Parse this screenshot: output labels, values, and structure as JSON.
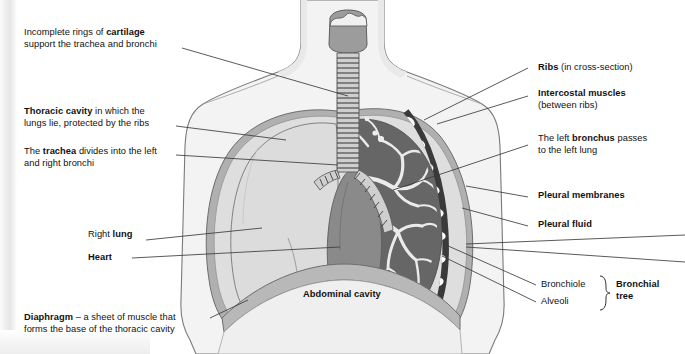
{
  "figure": {
    "title_text": "",
    "background_color": "#ffffff",
    "ink_color": "#111111"
  },
  "palette": {
    "skin_body": "#f2f2f2",
    "body_outline": "#6f6f6f",
    "pleural_membrane": "#a9a9a9",
    "pleural_fluid": "#e3e3e3",
    "right_lung": "#dcdcdc",
    "left_lung": "#6b6b6b",
    "bronchial_tree": "#efefef",
    "heart": "#8c8c8c",
    "trachea": "#9a9a9a",
    "rib_white": "#ffffff",
    "intercostal": "#3a3a3a",
    "diaphragm": "#b5b5b5",
    "abdominal_cavity": "#efefef",
    "leader_line": "#3c3c3c"
  },
  "labels": {
    "cartilage": {
      "line1_plain": "Incomplete rings of ",
      "line1_bold": "cartilage",
      "line2": "support the trachea and bronchi"
    },
    "thoracic_cavity": {
      "line1_bold": "Thoracic cavity",
      "line1_plain": " in which the",
      "line2": "lungs lie, protected by the ribs"
    },
    "trachea": {
      "line1_pre": "The ",
      "line1_bold": "trachea",
      "line1_post": " divides into the left",
      "line2": "and right bronchi"
    },
    "right_lung": {
      "pre": "Right ",
      "bold": "lung"
    },
    "heart": {
      "bold": "Heart"
    },
    "diaphragm": {
      "line1_bold": "Diaphragm",
      "line1_plain": " – a sheet of muscle that",
      "line2": "forms the base of the thoracic cavity"
    },
    "abdominal_cavity": {
      "bold": "Abdominal cavity"
    },
    "ribs": {
      "bold": "Ribs",
      "plain": " (in cross-section)"
    },
    "intercostal_muscles": {
      "line1_bold": "Intercostal muscles",
      "line2": "(between ribs)"
    },
    "left_bronchus": {
      "line1_pre": "The left ",
      "line1_bold": "bronchus",
      "line1_post": " passes",
      "line2": "to the left lung"
    },
    "pleural_membranes": {
      "bold": "Pleural membranes"
    },
    "pleural_fluid": {
      "bold": "Pleural fluid"
    },
    "bronchiole": {
      "plain": "Bronchiole"
    },
    "alveoli": {
      "plain": "Alveoli"
    },
    "bronchial_tree": {
      "line1_bold": "Bronchial",
      "line2_bold": "tree"
    }
  },
  "anatomy_parts": [
    "trachea",
    "cartilage-rings",
    "left-bronchus",
    "right-bronchus",
    "right-lung",
    "left-lung",
    "bronchial-tree",
    "bronchiole",
    "alveoli",
    "heart",
    "ribs",
    "intercostal-muscles",
    "pleural-membranes",
    "pleural-fluid",
    "diaphragm",
    "abdominal-cavity",
    "thoracic-cavity"
  ]
}
